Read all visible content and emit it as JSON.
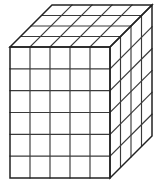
{
  "figure": {
    "name": "unit-cube-block",
    "projection": "oblique",
    "background_color": "#ffffff",
    "line_color": "#3a3a3a",
    "outline_color": "#222222",
    "dimensions": {
      "width_units": 5,
      "height_units": 6,
      "depth_units": 4,
      "total_cubes": 120
    },
    "geometry": {
      "front_top_left_x": 10,
      "front_top_left_y": 47,
      "front_width_px": 100,
      "front_height_px": 131,
      "depth_offset_x": 42,
      "depth_offset_y": -42
    },
    "faces": [
      {
        "name": "front-face",
        "columns": 5,
        "rows": 6,
        "visible_cells": 30
      },
      {
        "name": "top-face",
        "columns": 5,
        "rows": 4,
        "visible_cells": 20
      },
      {
        "name": "right-face",
        "columns": 4,
        "rows": 6,
        "visible_cells": 24
      }
    ]
  }
}
